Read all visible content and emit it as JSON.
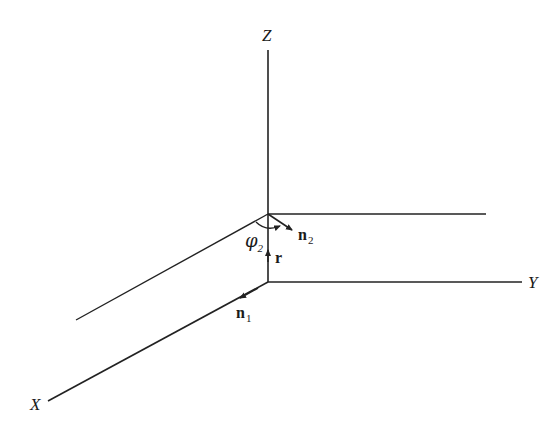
{
  "diagram": {
    "axes": {
      "z_label": "Z",
      "y_label": "Y",
      "x_label": "X"
    },
    "vectors": {
      "n1": {
        "symbol": "n",
        "subscript": "1"
      },
      "n2": {
        "symbol": "n",
        "subscript": "2"
      },
      "r": {
        "symbol": "r"
      }
    },
    "angle": {
      "symbol": "φ",
      "subscript": "2"
    },
    "colors": {
      "line": "#222222",
      "background": "#ffffff"
    }
  }
}
